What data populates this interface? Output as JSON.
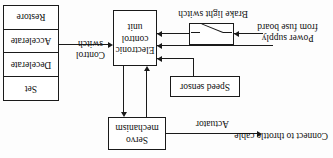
{
  "diagram": {
    "orientation": "rotated-180",
    "colors": {
      "stroke": "#1a1a1a",
      "text": "#111111",
      "background": "#fdfdfd"
    },
    "blocks": {
      "servo": "Servo\nmechanism",
      "servo_line1": "Servo",
      "servo_line2": "mechanism",
      "speed_sensor": "Speed sensor",
      "ecu_line1": "Electronic",
      "ecu_line2": "control",
      "ecu_line3": "unit"
    },
    "labels": {
      "actuator": "Actuator",
      "throttle": "Connect to throttle cable",
      "power_supply_line1": "Power supply",
      "power_supply_line2": "from fuse board",
      "brake_light_switch": "Brake light switch",
      "control_switch_line1": "Control",
      "control_switch_line2": "switch"
    },
    "control_switch_table": {
      "rows": [
        "Set",
        "Decelerate",
        "Accelerate",
        "Restore"
      ]
    }
  }
}
